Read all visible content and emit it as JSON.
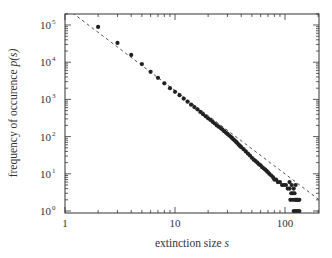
{
  "chart_data": {
    "type": "scatter",
    "title": "",
    "xlabel": "extinction size s",
    "xlabel_main": "extinction size ",
    "xlabel_var": "s",
    "ylabel": "frequency of occurence p(s)",
    "ylabel_main": "frequency of occurence ",
    "ylabel_var": "p(s)",
    "xscale": "log",
    "yscale": "log",
    "xlim": [
      1,
      200
    ],
    "ylim": [
      1,
      200000
    ],
    "x_ticks": [
      {
        "value": 1,
        "label": "1"
      },
      {
        "value": 10,
        "label": "10"
      },
      {
        "value": 100,
        "label": "100"
      }
    ],
    "y_ticks": [
      {
        "value": 1,
        "label": "10",
        "exp": "0"
      },
      {
        "value": 10,
        "label": "10",
        "exp": "1"
      },
      {
        "value": 100,
        "label": "10",
        "exp": "2"
      },
      {
        "value": 1000,
        "label": "10",
        "exp": "3"
      },
      {
        "value": 10000,
        "label": "10",
        "exp": "4"
      },
      {
        "value": 100000,
        "label": "10",
        "exp": "5"
      }
    ],
    "grid": false,
    "legend": null,
    "fit_line": {
      "style": "dashed",
      "form": "power-law p(s) = A * s^-tau",
      "tau": 2.24,
      "A": 300000,
      "x_range": [
        1.06,
        200
      ]
    },
    "series": [
      {
        "name": "extinction data",
        "marker": "filled-circle",
        "points": [
          [
            2,
            89000
          ],
          [
            3,
            33000
          ],
          [
            4,
            15700
          ],
          [
            5,
            8900
          ],
          [
            6,
            5500
          ],
          [
            7,
            3800
          ],
          [
            8,
            2700
          ],
          [
            9,
            2000
          ],
          [
            10,
            1600
          ],
          [
            11,
            1300
          ],
          [
            12,
            1050
          ],
          [
            13,
            870
          ],
          [
            14,
            720
          ],
          [
            15,
            620
          ],
          [
            16,
            540
          ],
          [
            17,
            460
          ],
          [
            18,
            400
          ],
          [
            19,
            350
          ],
          [
            20,
            310
          ],
          [
            21,
            280
          ],
          [
            22,
            250
          ],
          [
            23,
            225
          ],
          [
            24,
            200
          ],
          [
            25,
            185
          ],
          [
            26,
            170
          ],
          [
            27,
            155
          ],
          [
            28,
            140
          ],
          [
            29,
            128
          ],
          [
            30,
            118
          ],
          [
            31,
            108
          ],
          [
            32,
            100
          ],
          [
            33,
            92
          ],
          [
            34,
            84
          ],
          [
            35,
            78
          ],
          [
            36,
            72
          ],
          [
            37,
            66
          ],
          [
            38,
            60
          ],
          [
            39,
            56
          ],
          [
            40,
            52
          ],
          [
            42,
            46
          ],
          [
            44,
            40
          ],
          [
            46,
            35
          ],
          [
            48,
            31
          ],
          [
            50,
            27
          ],
          [
            52,
            24
          ],
          [
            54,
            22
          ],
          [
            56,
            20
          ],
          [
            58,
            18
          ],
          [
            60,
            17
          ],
          [
            62,
            15
          ],
          [
            64,
            14
          ],
          [
            66,
            13
          ],
          [
            68,
            12
          ],
          [
            70,
            11
          ],
          [
            72,
            10
          ],
          [
            75,
            9
          ],
          [
            78,
            8
          ],
          [
            80,
            7
          ],
          [
            83,
            7
          ],
          [
            86,
            6
          ],
          [
            90,
            6
          ],
          [
            94,
            5
          ],
          [
            98,
            5
          ],
          [
            102,
            5
          ],
          [
            106,
            4
          ],
          [
            110,
            4
          ],
          [
            114,
            3
          ],
          [
            118,
            3
          ],
          [
            122,
            3
          ],
          [
            126,
            2
          ],
          [
            130,
            2
          ],
          [
            135,
            2
          ],
          [
            110,
            6
          ],
          [
            115,
            5
          ],
          [
            120,
            4
          ],
          [
            125,
            5
          ],
          [
            112,
            2
          ],
          [
            118,
            2
          ],
          [
            124,
            2
          ],
          [
            130,
            2
          ],
          [
            120,
            1
          ],
          [
            125,
            1
          ],
          [
            130,
            1
          ],
          [
            135,
            1
          ]
        ]
      }
    ]
  },
  "colors": {
    "background": "#ffffff",
    "axis": "#333333",
    "marker": "#222222",
    "fit_line": "#555555"
  }
}
